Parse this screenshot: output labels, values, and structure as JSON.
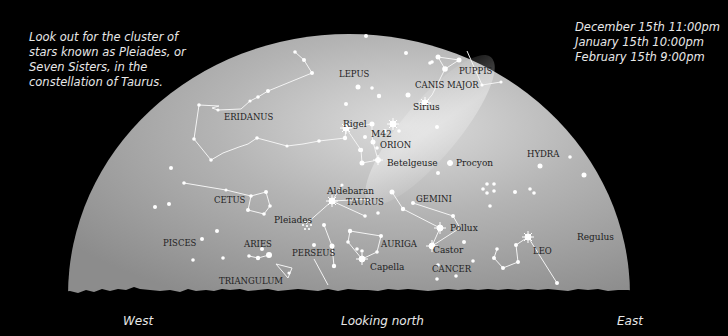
{
  "notes": {
    "tip": "Look out for the cluster of\nstars known as Pleiades, or\nSeven Sisters, in the\nconstellation of Taurus.",
    "times": "December 15th 11:00pm\nJanuary 15th 10:00pm\nFebruary 15th 9:00pm"
  },
  "directions": {
    "west": "West",
    "center": "Looking north",
    "east": "East"
  },
  "colors": {
    "background": "#000000",
    "sky_dark": "#8a8a8a",
    "sky_light": "#d8d8d8",
    "label": "#222222",
    "star": "#ffffff"
  },
  "constellations": [
    {
      "name": "ERIDANUS",
      "x": 224,
      "y": 120
    },
    {
      "name": "LEPUS",
      "x": 339,
      "y": 77
    },
    {
      "name": "CANIS MAJOR",
      "x": 415,
      "y": 88
    },
    {
      "name": "PUPPIS",
      "x": 459,
      "y": 74
    },
    {
      "name": "ORION",
      "x": 380,
      "y": 148
    },
    {
      "name": "HYDRA",
      "x": 527,
      "y": 157
    },
    {
      "name": "CETUS",
      "x": 214,
      "y": 203
    },
    {
      "name": "TAURUS",
      "x": 346,
      "y": 205
    },
    {
      "name": "GEMINI",
      "x": 416,
      "y": 202
    },
    {
      "name": "PISCES",
      "x": 163,
      "y": 246
    },
    {
      "name": "ARIES",
      "x": 244,
      "y": 247
    },
    {
      "name": "PERSEUS",
      "x": 292,
      "y": 256
    },
    {
      "name": "AURIGA",
      "x": 381,
      "y": 247
    },
    {
      "name": "LEO",
      "x": 533,
      "y": 254
    },
    {
      "name": "CANCER",
      "x": 432,
      "y": 272
    },
    {
      "name": "TRIANGULUM",
      "x": 219,
      "y": 284
    }
  ],
  "named_stars": [
    {
      "name": "Rigel",
      "x": 343,
      "y": 127
    },
    {
      "name": "M42",
      "x": 371,
      "y": 137
    },
    {
      "name": "Sirius",
      "x": 413,
      "y": 110
    },
    {
      "name": "Betelgeuse",
      "x": 387,
      "y": 166
    },
    {
      "name": "Procyon",
      "x": 456,
      "y": 166
    },
    {
      "name": "Aldebaran",
      "x": 327,
      "y": 194
    },
    {
      "name": "Pleiades",
      "x": 274,
      "y": 223
    },
    {
      "name": "Pollux",
      "x": 450,
      "y": 231
    },
    {
      "name": "Castor",
      "x": 433,
      "y": 253
    },
    {
      "name": "Capella",
      "x": 370,
      "y": 270
    },
    {
      "name": "Regulus",
      "x": 577,
      "y": 240
    }
  ]
}
